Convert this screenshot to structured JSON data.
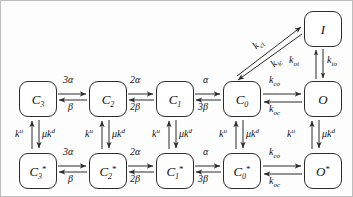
{
  "figure": {
    "type": "state-transition-diagram",
    "background_color": "#fdfdfd",
    "border_color": "#bdbdbd",
    "line_color": "#2b2b2b",
    "text_color": "#111111"
  },
  "states": {
    "top": [
      {
        "id": "I",
        "base": "I",
        "subscript": "",
        "superscript": "",
        "x": 303,
        "y": 10
      }
    ],
    "middle": [
      {
        "id": "C3",
        "base": "C",
        "subscript": "3",
        "superscript": "",
        "x": 18,
        "y": 80
      },
      {
        "id": "C2",
        "base": "C",
        "subscript": "2",
        "superscript": "",
        "x": 88,
        "y": 80
      },
      {
        "id": "C1",
        "base": "C",
        "subscript": "1",
        "superscript": "",
        "x": 155,
        "y": 80
      },
      {
        "id": "C0",
        "base": "C",
        "subscript": "0",
        "superscript": "",
        "x": 222,
        "y": 80
      },
      {
        "id": "O",
        "base": "O",
        "subscript": "",
        "superscript": "",
        "x": 303,
        "y": 80
      }
    ],
    "bottom": [
      {
        "id": "C3s",
        "base": "C",
        "subscript": "3",
        "superscript": "*",
        "x": 18,
        "y": 152
      },
      {
        "id": "C2s",
        "base": "C",
        "subscript": "2",
        "superscript": "*",
        "x": 88,
        "y": 152
      },
      {
        "id": "C1s",
        "base": "C",
        "subscript": "1",
        "superscript": "*",
        "x": 155,
        "y": 152
      },
      {
        "id": "C0s",
        "base": "C",
        "subscript": "0",
        "superscript": "*",
        "x": 222,
        "y": 152
      },
      {
        "id": "Os",
        "base": "O",
        "subscript": "",
        "superscript": "*",
        "x": 303,
        "y": 152
      }
    ]
  },
  "rates": {
    "middle_row": [
      {
        "id": "m-c3-c2-f",
        "forward": "3α",
        "backward": "β",
        "fx": 62,
        "fy": 74,
        "bx": 66,
        "by": 100
      },
      {
        "id": "m-c2-c1-f",
        "forward": "2α",
        "backward": "2β",
        "fx": 130,
        "fy": 74,
        "bx": 130,
        "by": 100
      },
      {
        "id": "m-c1-c0-f",
        "forward": "α",
        "backward": "3β",
        "fx": 201,
        "fy": 74,
        "bx": 196,
        "by": 100
      }
    ],
    "bottom_row": [
      {
        "id": "b-c3-c2-f",
        "forward": "3α",
        "backward": "β",
        "fx": 62,
        "fy": 146,
        "bx": 66,
        "by": 172
      },
      {
        "id": "b-c2-c1-f",
        "forward": "2α",
        "backward": "2β",
        "fx": 130,
        "fy": 146,
        "bx": 130,
        "by": 172
      },
      {
        "id": "b-c1-c0-f",
        "forward": "α",
        "backward": "3β",
        "fx": 201,
        "fy": 146,
        "bx": 196,
        "by": 172
      }
    ],
    "co_middle": {
      "forward_base": "k",
      "forward_sub": "co",
      "backward_base": "k",
      "backward_sub": "oc",
      "fx": 268,
      "fy": 74,
      "bx": 268,
      "by": 101
    },
    "co_bottom": {
      "forward_base": "k",
      "forward_sub": "co",
      "backward_base": "k",
      "backward_sub": "oc",
      "fx": 268,
      "fy": 146,
      "bx": 268,
      "by": 173
    },
    "oi": {
      "base": "k",
      "sub": "oi",
      "x": 290,
      "y": 54
    },
    "io": {
      "base": "k",
      "sub": "io",
      "x": 323,
      "y": 54
    },
    "ci": {
      "base": "k",
      "sub": "ci",
      "x": 256,
      "y": 37
    },
    "ic": {
      "base": "k",
      "sub": "ic",
      "x": 273,
      "y": 55
    },
    "vertical_up": {
      "base": "k",
      "sup": "u",
      "label": "k^u"
    },
    "vertical_down": {
      "base": "μk",
      "sup": "d",
      "label": "μk^d"
    },
    "vertical_columns": [
      {
        "id": "v-c3",
        "up_x": 22,
        "down_x": 38,
        "y": 128
      },
      {
        "id": "v-c2",
        "up_x": 92,
        "down_x": 108,
        "y": 128
      },
      {
        "id": "v-c1",
        "up_x": 159,
        "down_x": 175,
        "y": 128
      },
      {
        "id": "v-c0",
        "up_x": 226,
        "down_x": 242,
        "y": 128
      },
      {
        "id": "v-o",
        "up_x": 288,
        "down_x": 317,
        "y": 128
      }
    ]
  },
  "glyphs": {
    "alpha": "α",
    "beta": "β",
    "mu": "μ"
  }
}
